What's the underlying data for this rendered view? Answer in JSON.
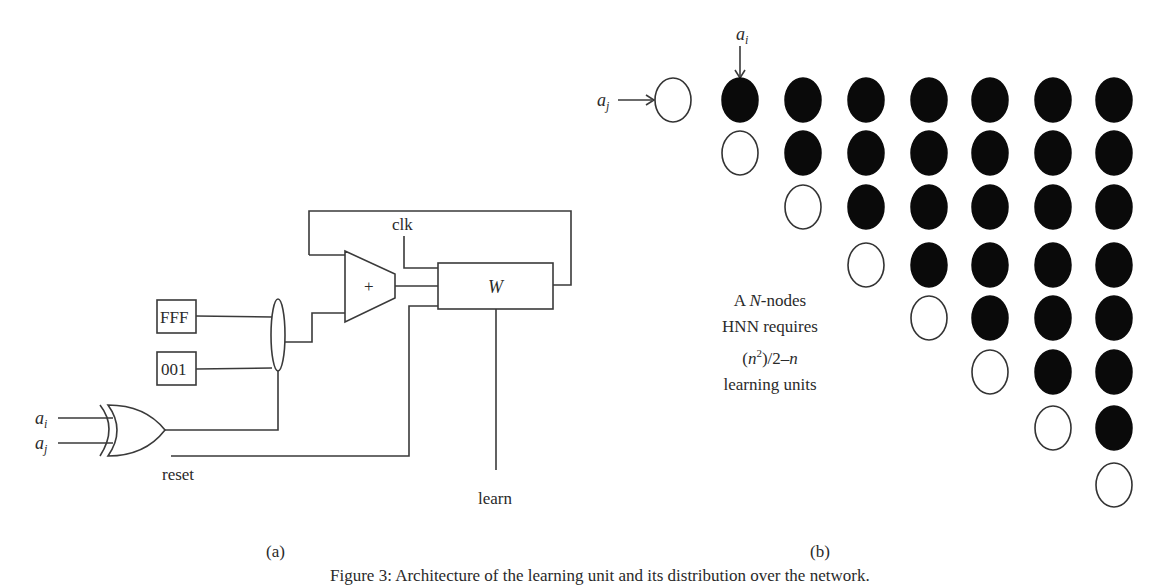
{
  "figure": {
    "panel_a": {
      "sublabel": "(a)",
      "blocks": {
        "const_fff": "FFF",
        "const_001": "001",
        "adder": "+",
        "register": "W"
      },
      "signals": {
        "clk": "clk",
        "reset": "reset",
        "learn": "learn",
        "input_i": "a",
        "input_i_sub": "i",
        "input_j": "a",
        "input_j_sub": "j"
      }
    },
    "panel_b": {
      "sublabel": "(b)",
      "arrow_labels": {
        "row_input": "a",
        "row_input_sub": "j",
        "col_input": "a",
        "col_input_sub": "i"
      },
      "note": {
        "line1_prefix": "A ",
        "line1_var": "N",
        "line1_suffix": "-nodes",
        "line2": "HNN requires",
        "line3_open": "(",
        "line3_var": "n",
        "line3_exp": "2",
        "line3_mid": ")/2–",
        "line3_var2": "n",
        "line4": "learning units"
      },
      "grid": {
        "rows": 8,
        "cols": 8,
        "col_x": [
          673,
          740,
          803,
          866,
          929,
          990,
          1053,
          1114
        ],
        "row_y": [
          100,
          153,
          207,
          265,
          318,
          372,
          428,
          485
        ],
        "rule": "empty on diagonal, filled above diagonal"
      }
    },
    "caption": "Figure 3: Architecture of the learning unit and its distribution over the network."
  }
}
